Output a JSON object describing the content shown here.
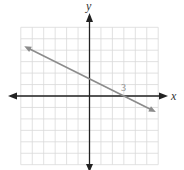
{
  "chart_data": {
    "type": "line",
    "title": "",
    "xlabel": "x",
    "ylabel": "y",
    "xlim": [
      -6,
      6
    ],
    "ylim": [
      -6,
      6
    ],
    "grid": true,
    "grid_step": 1,
    "legend": null,
    "series": [
      {
        "name": "line",
        "equation": "y = -0.5x + 1.5",
        "slope": -0.5,
        "intercept": 1.5,
        "x": [
          -5.7,
          5.8
        ],
        "y": [
          4.35,
          -1.4
        ],
        "arrows_both_ends": true
      }
    ],
    "annotations": [
      {
        "text": "3",
        "x": 3,
        "y": 0,
        "description": "x-intercept label"
      }
    ]
  },
  "colors": {
    "grid": "#d9d9d9",
    "axes": "#222222",
    "line": "#8c8c8c",
    "label": "#8a8a8a"
  }
}
